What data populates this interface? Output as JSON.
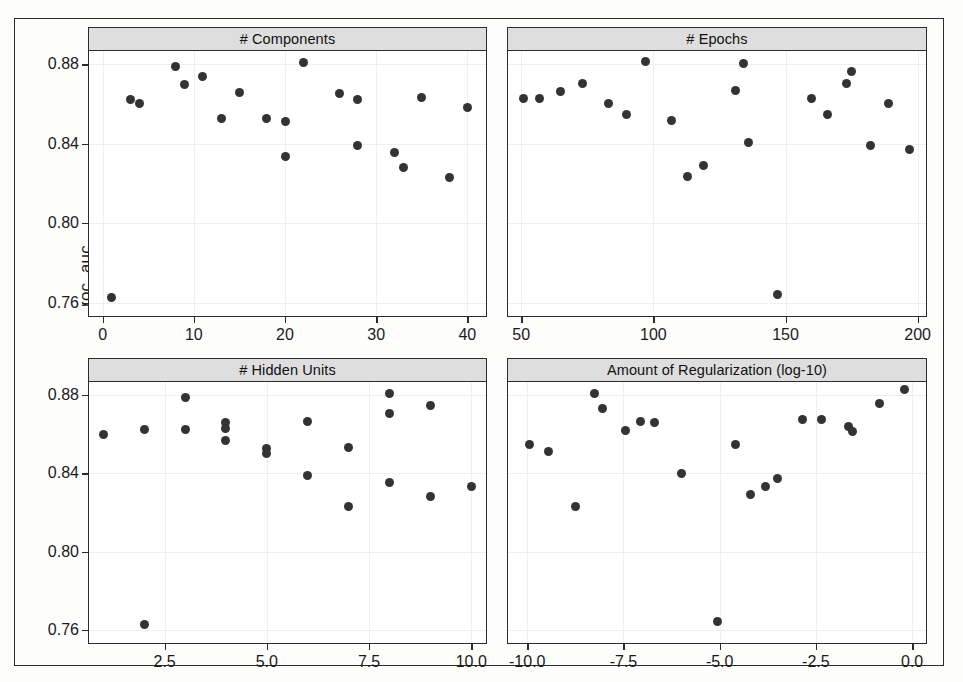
{
  "figure": {
    "y_axis_label": "roc_auc",
    "background_color": "#ffffff",
    "point_color": "#333333",
    "strip_color": "#dedede",
    "frame_color": "#2b2b2b"
  },
  "chart_data": {
    "type": "scatter",
    "title": "",
    "ylabel": "roc_auc",
    "ylim": [
      0.7533,
      0.8867
    ],
    "yticks": [
      0.88,
      0.84,
      0.8,
      0.76
    ],
    "ytick_labels": [
      "0.88",
      "0.84",
      "0.80",
      "0.76"
    ],
    "grid": true,
    "legend": "none",
    "layout": "2x2 trellis",
    "panels": [
      {
        "id": "components",
        "strip_label": "# Components",
        "xlabel": "",
        "xlim": [
          -1.5,
          42.0
        ],
        "xticks": [
          0,
          10,
          20,
          30,
          40
        ],
        "xtick_labels": [
          "0",
          "10",
          "20",
          "30",
          "40"
        ],
        "points": [
          {
            "x": 1,
            "y": 0.7625
          },
          {
            "x": 3,
            "y": 0.8625
          },
          {
            "x": 4,
            "y": 0.86
          },
          {
            "x": 8,
            "y": 0.879
          },
          {
            "x": 9,
            "y": 0.87
          },
          {
            "x": 11,
            "y": 0.874
          },
          {
            "x": 13,
            "y": 0.8525
          },
          {
            "x": 15,
            "y": 0.866
          },
          {
            "x": 18,
            "y": 0.8525
          },
          {
            "x": 20,
            "y": 0.851
          },
          {
            "x": 20,
            "y": 0.8335
          },
          {
            "x": 22,
            "y": 0.881
          },
          {
            "x": 26,
            "y": 0.8655
          },
          {
            "x": 28,
            "y": 0.8625
          },
          {
            "x": 28,
            "y": 0.839
          },
          {
            "x": 32,
            "y": 0.8355
          },
          {
            "x": 33,
            "y": 0.828
          },
          {
            "x": 35,
            "y": 0.8635
          },
          {
            "x": 38,
            "y": 0.823
          },
          {
            "x": 40,
            "y": 0.858
          }
        ]
      },
      {
        "id": "epochs",
        "strip_label": "# Epochs",
        "xlabel": "",
        "xlim": [
          45.0,
          203.0
        ],
        "xticks": [
          50,
          100,
          150,
          200
        ],
        "xtick_labels": [
          "50",
          "100",
          "150",
          "200"
        ],
        "points": [
          {
            "x": 51,
            "y": 0.863
          },
          {
            "x": 57,
            "y": 0.863
          },
          {
            "x": 65,
            "y": 0.8665
          },
          {
            "x": 73,
            "y": 0.8705
          },
          {
            "x": 83,
            "y": 0.86
          },
          {
            "x": 90,
            "y": 0.8545
          },
          {
            "x": 97,
            "y": 0.8815
          },
          {
            "x": 107,
            "y": 0.8515
          },
          {
            "x": 113,
            "y": 0.8235
          },
          {
            "x": 119,
            "y": 0.829
          },
          {
            "x": 131,
            "y": 0.867
          },
          {
            "x": 134,
            "y": 0.8805
          },
          {
            "x": 136,
            "y": 0.8405
          },
          {
            "x": 147,
            "y": 0.764
          },
          {
            "x": 160,
            "y": 0.863
          },
          {
            "x": 166,
            "y": 0.8545
          },
          {
            "x": 173,
            "y": 0.8705
          },
          {
            "x": 175,
            "y": 0.8765
          },
          {
            "x": 182,
            "y": 0.839
          },
          {
            "x": 189,
            "y": 0.86
          },
          {
            "x": 197,
            "y": 0.837
          }
        ]
      },
      {
        "id": "hidden_units",
        "strip_label": "# Hidden Units",
        "xlabel": "",
        "xlim": [
          0.65,
          10.35
        ],
        "xticks": [
          2.5,
          5.0,
          7.5,
          10.0
        ],
        "xtick_labels": [
          "2.5",
          "5.0",
          "7.5",
          "10.0"
        ],
        "points": [
          {
            "x": 1,
            "y": 0.86
          },
          {
            "x": 2,
            "y": 0.8625
          },
          {
            "x": 2,
            "y": 0.7625
          },
          {
            "x": 3,
            "y": 0.879
          },
          {
            "x": 3,
            "y": 0.8625
          },
          {
            "x": 4,
            "y": 0.866
          },
          {
            "x": 4,
            "y": 0.863
          },
          {
            "x": 4,
            "y": 0.857
          },
          {
            "x": 5,
            "y": 0.8525
          },
          {
            "x": 5,
            "y": 0.85
          },
          {
            "x": 6,
            "y": 0.8665
          },
          {
            "x": 6,
            "y": 0.839
          },
          {
            "x": 7,
            "y": 0.853
          },
          {
            "x": 7,
            "y": 0.823
          },
          {
            "x": 8,
            "y": 0.881
          },
          {
            "x": 8,
            "y": 0.8705
          },
          {
            "x": 8,
            "y": 0.8355
          },
          {
            "x": 9,
            "y": 0.8745
          },
          {
            "x": 9,
            "y": 0.828
          },
          {
            "x": 10,
            "y": 0.8335
          }
        ]
      },
      {
        "id": "regularization",
        "strip_label": "Amount of Regularization (log-10)",
        "xlabel": "",
        "xlim": [
          -10.5,
          0.35
        ],
        "xticks": [
          -10.0,
          -7.5,
          -5.0,
          -2.5,
          0.0
        ],
        "xtick_labels": [
          "-10.0",
          "-7.5",
          "-5.0",
          "-2.5",
          "0.0"
        ],
        "points": [
          {
            "x": -9.95,
            "y": 0.8545
          },
          {
            "x": -9.45,
            "y": 0.851
          },
          {
            "x": -8.75,
            "y": 0.823
          },
          {
            "x": -8.25,
            "y": 0.881
          },
          {
            "x": -8.05,
            "y": 0.873
          },
          {
            "x": -7.45,
            "y": 0.862
          },
          {
            "x": -7.05,
            "y": 0.8665
          },
          {
            "x": -6.7,
            "y": 0.866
          },
          {
            "x": -6.0,
            "y": 0.84
          },
          {
            "x": -5.05,
            "y": 0.764
          },
          {
            "x": -4.6,
            "y": 0.8545
          },
          {
            "x": -4.2,
            "y": 0.829
          },
          {
            "x": -3.8,
            "y": 0.8335
          },
          {
            "x": -3.5,
            "y": 0.8375
          },
          {
            "x": -2.85,
            "y": 0.8675
          },
          {
            "x": -2.35,
            "y": 0.8675
          },
          {
            "x": -1.65,
            "y": 0.864
          },
          {
            "x": -1.55,
            "y": 0.8615
          },
          {
            "x": -0.85,
            "y": 0.8755
          },
          {
            "x": -0.2,
            "y": 0.883
          }
        ]
      }
    ]
  }
}
